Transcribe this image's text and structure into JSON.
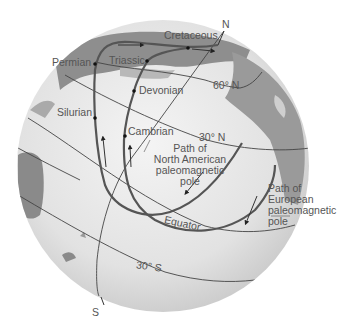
{
  "diagram": {
    "globe": {
      "fill": "#e3e3e3",
      "land": "#9a9a9a",
      "ocean_light": "#f0f0f0"
    },
    "poles": {
      "north": "N",
      "south": "S"
    },
    "latitudes": [
      {
        "id": "lat-60n",
        "label": "60° N"
      },
      {
        "id": "lat-30n",
        "label": "30° N"
      },
      {
        "id": "equator",
        "label": "Equator"
      },
      {
        "id": "lat-30s",
        "label": "30° S"
      }
    ],
    "periods": [
      {
        "id": "cretaceous",
        "label": "Cretaceous"
      },
      {
        "id": "permian",
        "label": "Permian"
      },
      {
        "id": "triassic",
        "label": "Triassic"
      },
      {
        "id": "devonian",
        "label": "Devonian"
      },
      {
        "id": "silurian",
        "label": "Silurian"
      },
      {
        "id": "cambrian",
        "label": "Cambrian"
      }
    ],
    "paths": [
      {
        "id": "north-american",
        "lines": [
          "Path of",
          "North American",
          "paleomagnetic",
          "pole"
        ]
      },
      {
        "id": "european",
        "lines": [
          "Path of",
          "European",
          "paleomagnetic",
          "pole"
        ]
      }
    ],
    "colors": {
      "path_stroke": "#555555",
      "grid_stroke": "#444444",
      "text": "#555555"
    }
  }
}
